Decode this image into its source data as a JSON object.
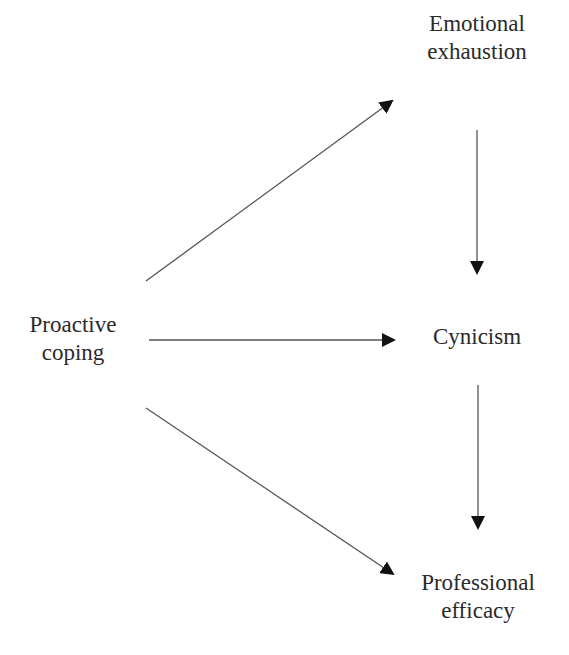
{
  "diagram": {
    "type": "path-model",
    "nodes": [
      {
        "id": "proactive",
        "lines": [
          "Proactive",
          "coping"
        ]
      },
      {
        "id": "emotional",
        "lines": [
          "Emotional",
          "exhaustion"
        ]
      },
      {
        "id": "cynicism",
        "lines": [
          "Cynicism"
        ]
      },
      {
        "id": "efficacy",
        "lines": [
          "Professional",
          "efficacy"
        ]
      }
    ],
    "edges": [
      {
        "from": "proactive",
        "to": "emotional"
      },
      {
        "from": "proactive",
        "to": "cynicism"
      },
      {
        "from": "proactive",
        "to": "efficacy"
      },
      {
        "from": "emotional",
        "to": "cynicism"
      },
      {
        "from": "cynicism",
        "to": "efficacy"
      }
    ],
    "colors": {
      "line": "#555555",
      "arrowhead": "#111111",
      "text": "#2a2a2a",
      "background": "#ffffff"
    }
  }
}
